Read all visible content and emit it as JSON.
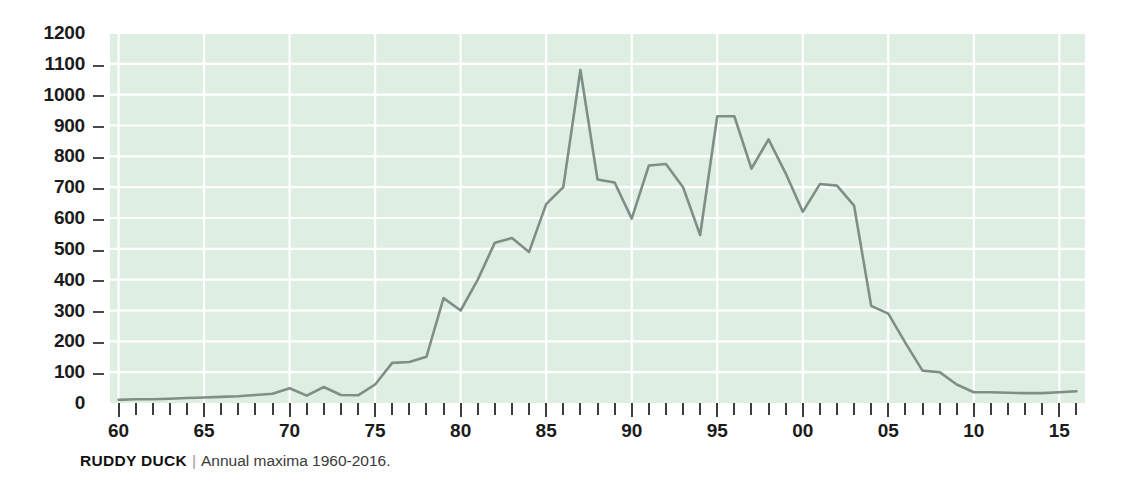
{
  "caption": {
    "title": "RUDDY DUCK",
    "separator": "|",
    "subtitle": "Annual maxima 1960-2016."
  },
  "chart_data": {
    "type": "line",
    "title": "RUDDY DUCK",
    "subtitle": "Annual maxima 1960-2016.",
    "xlabel": "",
    "ylabel": "",
    "xlim": [
      1959.5,
      2016.5
    ],
    "ylim": [
      0,
      1200
    ],
    "ytick_values": [
      0,
      100,
      200,
      300,
      400,
      500,
      600,
      700,
      800,
      900,
      1000,
      1100,
      1200
    ],
    "ytick_labels": [
      "0",
      "100",
      "200",
      "300",
      "400",
      "500",
      "600",
      "700",
      "800",
      "900",
      "1000",
      "1100",
      "1200"
    ],
    "xtick_values": [
      1960,
      1965,
      1970,
      1975,
      1980,
      1985,
      1990,
      1995,
      2000,
      2005,
      2010,
      2015
    ],
    "xtick_labels": [
      "60",
      "65",
      "70",
      "75",
      "80",
      "85",
      "90",
      "95",
      "00",
      "05",
      "10",
      "15"
    ],
    "xtick_minor_step": 1,
    "grid": true,
    "grid_color": "#ffffff",
    "plot_background": "#dfeee2",
    "line_color": "#7e8f87",
    "legend": null,
    "x": [
      1960,
      1961,
      1962,
      1963,
      1964,
      1965,
      1966,
      1967,
      1968,
      1969,
      1970,
      1971,
      1972,
      1973,
      1974,
      1975,
      1976,
      1977,
      1978,
      1979,
      1980,
      1981,
      1982,
      1983,
      1984,
      1985,
      1986,
      1987,
      1988,
      1989,
      1990,
      1991,
      1992,
      1993,
      1994,
      1995,
      1996,
      1997,
      1998,
      1999,
      2000,
      2001,
      2002,
      2003,
      2004,
      2005,
      2006,
      2007,
      2008,
      2009,
      2010,
      2011,
      2012,
      2013,
      2014,
      2015,
      2016
    ],
    "values": [
      10,
      12,
      12,
      14,
      16,
      18,
      20,
      22,
      26,
      30,
      48,
      24,
      52,
      26,
      25,
      60,
      130,
      133,
      150,
      340,
      300,
      400,
      520,
      535,
      490,
      645,
      700,
      1080,
      725,
      715,
      598,
      770,
      775,
      700,
      545,
      930,
      930,
      760,
      855,
      745,
      620,
      710,
      705,
      640,
      315,
      290,
      195,
      105,
      100,
      60,
      35,
      35,
      33,
      32,
      32,
      35,
      38
    ]
  }
}
